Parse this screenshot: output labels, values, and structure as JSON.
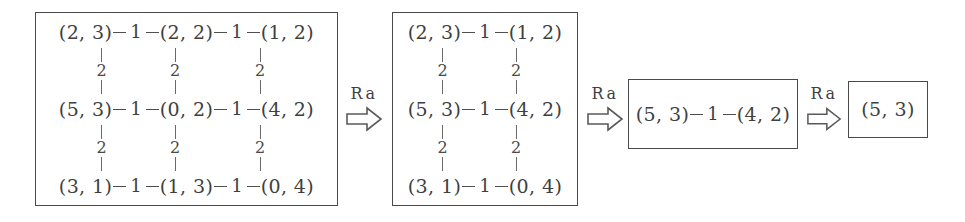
{
  "diagram": {
    "arrow_label": "Ra",
    "edge_weight_horizontal": "1",
    "edge_weight_vertical": "2",
    "stages": [
      {
        "id": "stage-1",
        "columns": 3,
        "rows": [
          {
            "nodes": [
              "(2, 3)",
              "(2, 2)",
              "(1, 2)"
            ]
          },
          {
            "nodes": [
              "(5, 3)",
              "(0, 2)",
              "(4, 2)"
            ]
          },
          {
            "nodes": [
              "(3, 1)",
              "(1, 3)",
              "(0, 4)"
            ]
          }
        ],
        "horizontal_weights": [
          [
            "1",
            "1"
          ],
          [
            "1",
            "1"
          ],
          [
            "1",
            "1"
          ]
        ],
        "vertical_weights": [
          [
            "2",
            "2",
            "2"
          ],
          [
            "2",
            "2",
            "2"
          ]
        ]
      },
      {
        "id": "stage-2",
        "columns": 2,
        "rows": [
          {
            "nodes": [
              "(2, 3)",
              "(1, 2)"
            ]
          },
          {
            "nodes": [
              "(5, 3)",
              "(4, 2)"
            ]
          },
          {
            "nodes": [
              "(3, 1)",
              "(0, 4)"
            ]
          }
        ],
        "horizontal_weights": [
          [
            "1"
          ],
          [
            "1"
          ],
          [
            "1"
          ]
        ],
        "vertical_weights": [
          [
            "2",
            "2"
          ],
          [
            "2",
            "2"
          ]
        ]
      },
      {
        "id": "stage-3",
        "columns": 2,
        "rows": [
          {
            "nodes": [
              "(5, 3)",
              "(4, 2)"
            ]
          }
        ],
        "horizontal_weights": [
          [
            "1"
          ]
        ],
        "vertical_weights": []
      },
      {
        "id": "stage-4",
        "columns": 1,
        "rows": [
          {
            "nodes": [
              "(5, 3)"
            ]
          }
        ],
        "horizontal_weights": [],
        "vertical_weights": []
      }
    ],
    "arrows": [
      {
        "id": "arrow-1",
        "label": "Ra"
      },
      {
        "id": "arrow-2",
        "label": "Ra"
      },
      {
        "id": "arrow-3",
        "label": "Ra"
      }
    ]
  },
  "colors": {
    "background": "#ffffff",
    "ink": "#3f3f3f",
    "border": "#4a4a4a",
    "edge": "#5a5a5a"
  }
}
